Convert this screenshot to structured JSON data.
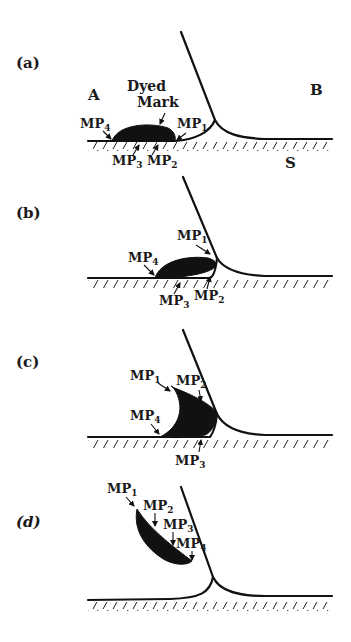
{
  "figure": {
    "panels": [
      {
        "id": "a",
        "label": "(a)",
        "phase_left": "A",
        "phase_right": "B",
        "substrate": "S",
        "mark_label_line1": "Dyed",
        "mark_label_line2": "Mark",
        "markers": [
          "MP",
          "MP",
          "MP",
          "MP"
        ],
        "marker_subs": [
          "1",
          "2",
          "3",
          "4"
        ]
      },
      {
        "id": "b",
        "label": "(b)",
        "markers": [
          "MP",
          "MP",
          "MP",
          "MP"
        ],
        "marker_subs": [
          "1",
          "2",
          "3",
          "4"
        ]
      },
      {
        "id": "c",
        "label": "(c)",
        "markers": [
          "MP",
          "MP",
          "MP",
          "MP"
        ],
        "marker_subs": [
          "1",
          "2",
          "3",
          "4"
        ]
      },
      {
        "id": "d",
        "label": "(d)",
        "markers": [
          "MP",
          "MP",
          "MP",
          "MP"
        ],
        "marker_subs": [
          "1",
          "2",
          "3",
          "4"
        ]
      }
    ]
  }
}
